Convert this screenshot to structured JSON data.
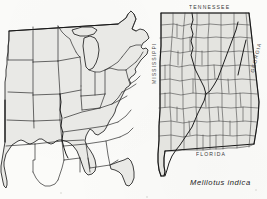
{
  "figure": {
    "kind": "species-distribution-map-plate",
    "background_color": "#fbfbf9",
    "ink_color": "#2b2b2b",
    "land_fill_color": "#e9e9e6",
    "county_fill_color": "#e4e4e0"
  },
  "panels": {
    "us": {
      "name": "eastern-united-states-outline-map",
      "description": "Outline map of the central and eastern United States showing state boundaries"
    },
    "alabama": {
      "name": "alabama-county-map",
      "description": "Detailed county map of Alabama with surrounding state names"
    }
  },
  "labels": {
    "tennessee": "TENNESSEE",
    "mississippi": "MISSISSIPPI",
    "georgia": "GEORGIA",
    "florida": "FLORIDA"
  },
  "caption": {
    "species": "Melilotus indica"
  }
}
